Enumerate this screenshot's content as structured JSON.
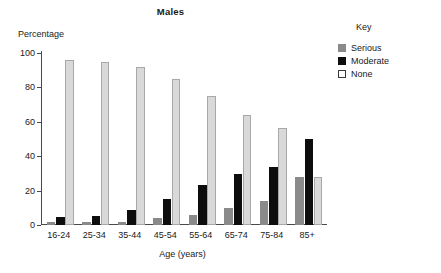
{
  "chart_data": {
    "type": "bar",
    "title": "Males",
    "xlabel": "Age (years)",
    "ylabel": "Percentage",
    "ylim": [
      0,
      100
    ],
    "yticks": [
      0,
      20,
      40,
      60,
      80,
      100
    ],
    "grid": false,
    "legend_position": "right",
    "legend_title": "Key",
    "categories": [
      "16-24",
      "25-34",
      "35-44",
      "45-54",
      "55-64",
      "65-74",
      "75-84",
      "85+"
    ],
    "series": [
      {
        "name": "Serious",
        "color": "#8a8a8a",
        "values": [
          1.5,
          1.5,
          2,
          4,
          6,
          10,
          14,
          28
        ]
      },
      {
        "name": "Moderate",
        "color": "#0d0d0d",
        "values": [
          4.5,
          5.5,
          9,
          15,
          23,
          29.5,
          33.5,
          50
        ]
      },
      {
        "name": "None",
        "color": "#d9d9d9",
        "values": [
          96,
          95,
          92,
          85,
          75,
          64,
          56.5,
          28
        ]
      }
    ]
  }
}
